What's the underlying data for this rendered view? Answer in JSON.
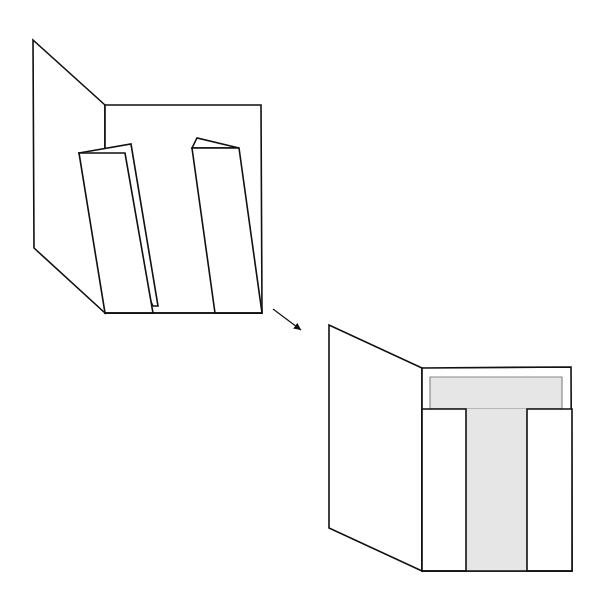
{
  "diagram": {
    "colors": {
      "line": "#111111",
      "background": "#ffffff",
      "fill_gray": "#e6e6e6",
      "fill_border": "#8a8a8a"
    },
    "steps": [
      {
        "name": "step-1-folded-strips",
        "left_panel": "33,40 34,248 105,313 105,105",
        "back_panel": "105,105 261,105 262,313 105,313",
        "left_strip_back": "79,153 131,144 158,306 153,306",
        "left_strip_front": "79,153 125,153 153,313 105,313",
        "right_strip_back": "192,148 197,138 239,148",
        "right_strip_front": "192,148 239,148 262,313 215,313"
      },
      {
        "name": "step-2-t-shape",
        "left_panel": "329,325 329,528 422,571 422,368",
        "back_panel": "422,368 571,367 572,571 422,571",
        "t_top": "430,377 562,377 562,409 430,409",
        "t_stem": "466,409 527,409 527,571 466,571",
        "left_white": "422,409 466,409 466,571 422,571",
        "right_white": "527,409 572,409 572,571 527,571"
      }
    ],
    "arrow": {
      "x1": 273,
      "y1": 309,
      "x2": 303,
      "y2": 331
    }
  }
}
